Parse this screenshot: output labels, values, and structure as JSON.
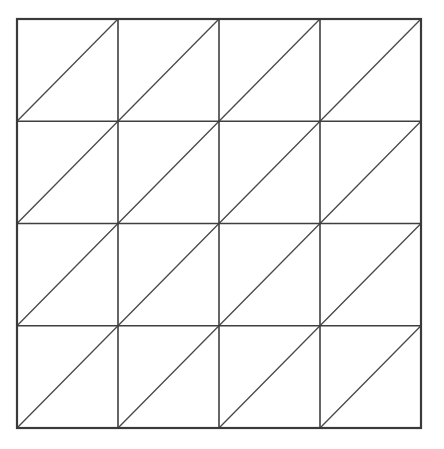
{
  "page": {
    "background_color": "#ffffff",
    "width": 444,
    "height": 449
  },
  "figure": {
    "name": "triangulated-grid",
    "geometry": {
      "origin_x": 17,
      "origin_y": 19,
      "grid_width": 404,
      "grid_height": 409,
      "rows": 4,
      "columns": 4,
      "cell_width": 101,
      "cell_height": 102.25,
      "total_cells": 16,
      "total_triangles": 32,
      "diagonal_direction": "anti-diagonal",
      "diagonal_from": "bottom-left",
      "diagonal_to": "top-right"
    },
    "x_grid_lines": [
      17,
      118,
      219,
      320,
      421
    ],
    "y_grid_lines": [
      19,
      121.25,
      223.5,
      325.75,
      428
    ],
    "style": {
      "outer_border_color": "#3a3a3a",
      "outer_border_width": 2.2,
      "inner_line_color": "#3f3f3f",
      "inner_line_width": 1.6,
      "diagonal_line_color": "#4a4a4a",
      "diagonal_line_width": 1.3,
      "fill_color": "#ffffff"
    }
  },
  "chart_data": {
    "type": "diagram",
    "rows": 4,
    "columns": 4,
    "cells": [
      {
        "row": 0,
        "col": 0,
        "diagonal": "anti"
      },
      {
        "row": 0,
        "col": 1,
        "diagonal": "anti"
      },
      {
        "row": 0,
        "col": 2,
        "diagonal": "anti"
      },
      {
        "row": 0,
        "col": 3,
        "diagonal": "anti"
      },
      {
        "row": 1,
        "col": 0,
        "diagonal": "anti"
      },
      {
        "row": 1,
        "col": 1,
        "diagonal": "anti"
      },
      {
        "row": 1,
        "col": 2,
        "diagonal": "anti"
      },
      {
        "row": 1,
        "col": 3,
        "diagonal": "anti"
      },
      {
        "row": 2,
        "col": 0,
        "diagonal": "anti"
      },
      {
        "row": 2,
        "col": 1,
        "diagonal": "anti"
      },
      {
        "row": 2,
        "col": 2,
        "diagonal": "anti"
      },
      {
        "row": 2,
        "col": 3,
        "diagonal": "anti"
      },
      {
        "row": 3,
        "col": 0,
        "diagonal": "anti"
      },
      {
        "row": 3,
        "col": 1,
        "diagonal": "anti"
      },
      {
        "row": 3,
        "col": 2,
        "diagonal": "anti"
      },
      {
        "row": 3,
        "col": 3,
        "diagonal": "anti"
      }
    ]
  }
}
